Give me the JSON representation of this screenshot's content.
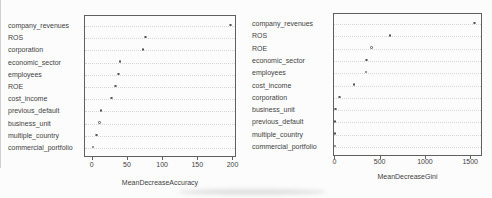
{
  "figure": {
    "background": "#fcfcfc",
    "border_color": "#606060",
    "grid_color": "#d6d6d6",
    "text_color": "#424242",
    "point_color": "#565656"
  },
  "chart_data": [
    {
      "type": "scatter",
      "chart_style": "dot-plot",
      "title": "",
      "xlabel": "MeanDecreaseAccuracy",
      "ylabel": "",
      "categories": [
        "company_revenues",
        "ROS",
        "corporation",
        "economic_sector",
        "employees",
        "ROE",
        "cost_income",
        "previous_default",
        "business_unit",
        "multiple_country",
        "commercial_portfolio"
      ],
      "values": [
        197,
        76,
        73,
        40,
        38,
        34,
        28,
        13,
        11,
        7,
        2
      ],
      "xlim": [
        -11,
        205
      ],
      "xticks": [
        0,
        50,
        100,
        150,
        200
      ],
      "grid": "dotted-horizontal",
      "legend": "none",
      "point_style": "open-circle"
    },
    {
      "type": "scatter",
      "chart_style": "dot-plot",
      "title": "",
      "xlabel": "MeanDecreaseGini",
      "ylabel": "",
      "categories": [
        "company_revenues",
        "ROS",
        "ROE",
        "economic_sector",
        "employees",
        "cost_income",
        "corporation",
        "business_unit",
        "previous_default",
        "multiple_country",
        "commercial_portfolio"
      ],
      "values": [
        1550,
        615,
        412,
        357,
        350,
        218,
        60,
        14,
        8,
        5,
        5
      ],
      "xlim": [
        -15,
        1630
      ],
      "xticks": [
        0,
        500,
        1000,
        1500
      ],
      "grid": "dotted-horizontal",
      "legend": "none",
      "point_style": "open-circle"
    }
  ]
}
